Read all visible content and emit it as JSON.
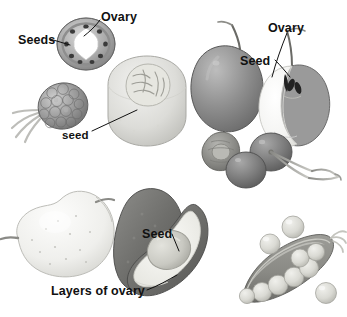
{
  "figure": {
    "background_color": "#ffffff",
    "text_color": "#111111",
    "width": 347,
    "height": 317
  },
  "labels": [
    {
      "id": "ovary-top-left",
      "text": "Ovary",
      "x": 101,
      "y": 11,
      "size": "big"
    },
    {
      "id": "seeds-top-left",
      "text": "Seeds",
      "x": 18,
      "y": 34,
      "size": "big"
    },
    {
      "id": "seed-lower-left",
      "text": "seed",
      "x": 62,
      "y": 130,
      "size": "lo"
    },
    {
      "id": "ovary-apple",
      "text": "Ovary",
      "x": 268,
      "y": 22,
      "size": "big"
    },
    {
      "id": "seed-apple",
      "text": "Seed",
      "x": 240,
      "y": 55,
      "size": "big"
    },
    {
      "id": "seed-avocado",
      "text": "Seed",
      "x": 142,
      "y": 228,
      "size": "big"
    },
    {
      "id": "layers-of-ovary",
      "text": "Layers of ovary",
      "x": 51,
      "y": 285,
      "size": "big"
    }
  ],
  "specimens": [
    {
      "id": "pepper-cross-section",
      "name": "pepper cross section with ring of seeds",
      "seed_count": 9
    },
    {
      "id": "raspberry-aggregate",
      "name": "aggregate berry with stem",
      "seed_count": 0
    },
    {
      "id": "peach-half",
      "name": "cut stone fruit half showing seed",
      "seed_count": 1
    },
    {
      "id": "apple-whole",
      "name": "whole apple with stem",
      "seed_count": 0
    },
    {
      "id": "apple-half",
      "name": "apple half showing ovary core and seeds",
      "seed_count": 2
    },
    {
      "id": "pit-cross-section",
      "name": "cherry pit cross section",
      "seed_count": 1
    },
    {
      "id": "cherries",
      "name": "pair of cherries with stems",
      "seed_count": 0
    },
    {
      "id": "pear",
      "name": "whole pear with stem",
      "seed_count": 0
    },
    {
      "id": "avocado-half",
      "name": "avocado half showing seed and ovary layers",
      "seed_count": 1
    },
    {
      "id": "pea-pod",
      "name": "opened pea pod",
      "seed_count": 7
    },
    {
      "id": "loose-peas",
      "name": "loose peas beside pod",
      "seed_count": 3
    }
  ],
  "leader_lines": [
    {
      "id": "leader-ovary-top-left",
      "from": [
        100,
        18
      ],
      "to": [
        83,
        36
      ]
    },
    {
      "id": "leader-seeds-top-left",
      "from": [
        50,
        39
      ],
      "to": [
        72,
        46
      ]
    },
    {
      "id": "leader-seed-lower-left",
      "from": [
        92,
        130
      ],
      "to": [
        136,
        110
      ]
    },
    {
      "id": "leader-ovary-apple",
      "from": [
        286,
        32
      ],
      "to": [
        272,
        77
      ]
    },
    {
      "id": "leader-seed-apple",
      "from": [
        274,
        60
      ],
      "to": [
        289,
        76
      ]
    },
    {
      "id": "leader-seed-avocado",
      "from": [
        172,
        234
      ],
      "to": [
        178,
        250
      ]
    },
    {
      "id": "leader-layers-ovary",
      "from": [
        147,
        290
      ],
      "to": [
        176,
        276
      ]
    }
  ]
}
